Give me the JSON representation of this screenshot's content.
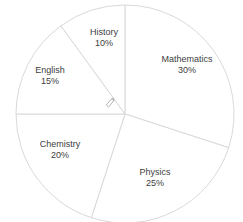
{
  "chart_data": {
    "type": "pie",
    "title": "",
    "categories": [
      "Mathematics",
      "Physics",
      "Chemistry",
      "English",
      "History"
    ],
    "values": [
      30,
      25,
      20,
      15,
      10
    ],
    "value_labels": [
      "30%",
      "25%",
      "20%",
      "15%",
      "10%"
    ],
    "legend": false,
    "slice_fill": "#ffffff",
    "slice_border": "#d9d9d9"
  },
  "labels": [
    {
      "name": "Mathematics",
      "pct": "30%"
    },
    {
      "name": "Physics",
      "pct": "25%"
    },
    {
      "name": "Chemistry",
      "pct": "20%"
    },
    {
      "name": "English",
      "pct": "15%"
    },
    {
      "name": "History",
      "pct": "10%"
    }
  ]
}
